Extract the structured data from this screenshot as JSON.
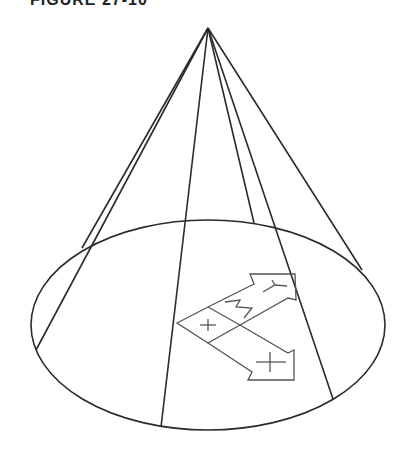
{
  "title": "FIGURE 27-10",
  "diagram": {
    "type": "cone-with-ucs-icon",
    "apex": [
      208,
      28
    ],
    "base_ellipse": {
      "cx": 208,
      "cy": 325,
      "rx": 177,
      "ry": 105
    },
    "generator_lines": [
      {
        "from": [
          208,
          28
        ],
        "to": [
          82,
          248
        ]
      },
      {
        "from": [
          208,
          28
        ],
        "to": [
          36,
          350
        ]
      },
      {
        "from": [
          208,
          28
        ],
        "to": [
          161,
          427
        ]
      },
      {
        "from": [
          208,
          28
        ],
        "to": [
          254,
          223
        ]
      },
      {
        "from": [
          208,
          28
        ],
        "to": [
          333,
          399
        ]
      },
      {
        "from": [
          208,
          28
        ],
        "to": [
          362,
          270
        ]
      }
    ],
    "ucs_icon": {
      "axis_labels": [
        "X",
        "Y",
        "Z"
      ]
    },
    "stroke_color": "#2a2a2a",
    "icon_color": "#555555"
  }
}
